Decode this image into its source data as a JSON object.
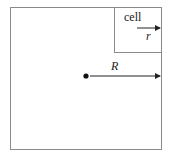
{
  "diagram": {
    "labels": {
      "cell": "cell",
      "small_radius": "r",
      "large_radius": "R"
    },
    "colors": {
      "outline": "#8a8a8a",
      "arrow": "#222222",
      "dot": "#111111",
      "background": "#ffffff"
    },
    "elements": [
      {
        "id": "outer-square",
        "kind": "square",
        "description": "domain"
      },
      {
        "id": "cell-box",
        "kind": "square",
        "description": "cell in top-right corner"
      },
      {
        "id": "center-dot",
        "kind": "point",
        "description": "center of domain"
      },
      {
        "id": "R-arrow",
        "kind": "arrow",
        "from": "center-dot",
        "to": "right edge",
        "label": "R"
      },
      {
        "id": "r-arrow",
        "kind": "arrow",
        "within": "cell-box",
        "to": "right edge",
        "label": "r"
      }
    ]
  }
}
